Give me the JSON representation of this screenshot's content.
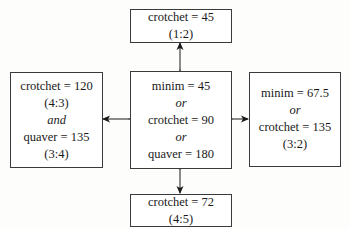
{
  "diagram": {
    "boxes": {
      "top": {
        "lines": [
          "crotchet = 45",
          "(1:2)"
        ]
      },
      "left": {
        "lines": [
          "crotchet = 120",
          "(4:3)",
          "and",
          "quaver = 135",
          "(3:4)"
        ]
      },
      "center": {
        "lines": [
          "minim = 45",
          "or",
          "crotchet = 90",
          "or",
          "quaver = 180"
        ]
      },
      "right": {
        "lines": [
          "minim = 67.5",
          "or",
          "crotchet = 135",
          "(3:2)"
        ]
      },
      "bottom": {
        "lines": [
          "crotchet = 72",
          "(4:5)"
        ]
      }
    },
    "connections": [
      {
        "from": "center",
        "to": "top",
        "type": "double-arrow"
      },
      {
        "from": "center",
        "to": "left",
        "type": "double-arrow"
      },
      {
        "from": "center",
        "to": "right",
        "type": "double-arrow"
      },
      {
        "from": "center",
        "to": "bottom",
        "type": "double-arrow"
      }
    ],
    "colors": {
      "border": "#3a3a3a",
      "arrow": "#1a1a1a",
      "background": "#fdfdfb"
    }
  }
}
